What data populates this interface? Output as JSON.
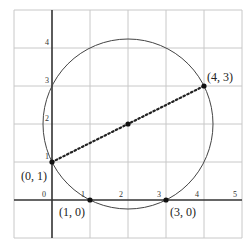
{
  "diagram": {
    "type": "coordinate-plane-circle",
    "grid": {
      "x_range": [
        -1,
        5
      ],
      "y_range": [
        -1,
        5
      ],
      "unit_px": 38,
      "origin_px": [
        52,
        200
      ]
    },
    "x_ticks": [
      "0",
      "1",
      "2",
      "3",
      "4",
      "5"
    ],
    "y_ticks": [
      "1",
      "2",
      "3",
      "4"
    ],
    "circle": {
      "center": [
        2,
        2
      ],
      "radius": "√5"
    },
    "diameter": {
      "from": [
        0,
        1
      ],
      "to": [
        4,
        3
      ],
      "style": "dotted"
    },
    "points": [
      {
        "label": "(0, 1)",
        "x": 0,
        "y": 1
      },
      {
        "label": "(4, 3)",
        "x": 4,
        "y": 3
      },
      {
        "label": "(1, 0)",
        "x": 1,
        "y": 0
      },
      {
        "label": "(3, 0)",
        "x": 3,
        "y": 0
      },
      {
        "label": "",
        "x": 2,
        "y": 2
      }
    ]
  }
}
